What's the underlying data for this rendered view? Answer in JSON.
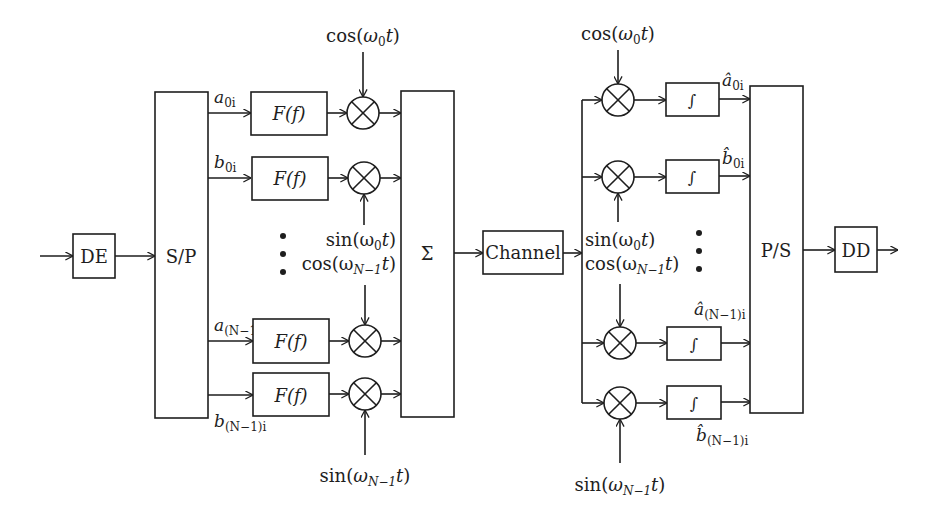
{
  "colors": {
    "stroke": "#1e1e1e",
    "background": "#ffffff"
  },
  "transmitter": {
    "de_label": "DE",
    "sp_label": "S/P",
    "sum_label": "Σ",
    "filter_label": "F(f)",
    "inputs": [
      {
        "base": "a",
        "sub": "0i"
      },
      {
        "base": "b",
        "sub": "0i"
      },
      {
        "base": "a",
        "sub": "(N−1)i"
      },
      {
        "base": "b",
        "sub": "(N−1)i"
      }
    ],
    "carriers": {
      "cos0": {
        "fn": "cos(",
        "w": "ω",
        "sub": "0",
        "t": "t",
        "close": ")"
      },
      "sin0": {
        "fn": "sin(",
        "w": "ω",
        "sub": "0",
        "t": "t",
        "close": ")"
      },
      "cosN": {
        "fn": "cos(",
        "w": "ω",
        "sub": "N−1",
        "t": "t",
        "close": ")"
      },
      "sinN": {
        "fn": "sin(",
        "w": "ω",
        "sub": "N−1",
        "t": "t",
        "close": ")"
      }
    }
  },
  "channel": {
    "label": "Channel"
  },
  "receiver": {
    "integrator_label": "∫",
    "ps_label": "P/S",
    "dd_label": "DD",
    "outputs": [
      {
        "base": "â",
        "sub": "0i"
      },
      {
        "base": "b̂",
        "sub": "0i"
      },
      {
        "base": "â",
        "sub": "(N−1)i"
      },
      {
        "base": "b̂",
        "sub": "(N−1)i"
      }
    ],
    "carriers": {
      "cos0": {
        "fn": "cos(",
        "w": "ω",
        "sub": "0",
        "t": "t",
        "close": ")"
      },
      "sin0": {
        "fn": "sin(",
        "w": "ω",
        "sub": "0",
        "t": "t",
        "close": ")"
      },
      "cosN": {
        "fn": "cos(",
        "w": "ω",
        "sub": "N−1",
        "t": "t",
        "close": ")"
      },
      "sinN": {
        "fn": "sin(",
        "w": "ω",
        "sub": "N−1",
        "t": "t",
        "close": ")"
      }
    }
  }
}
